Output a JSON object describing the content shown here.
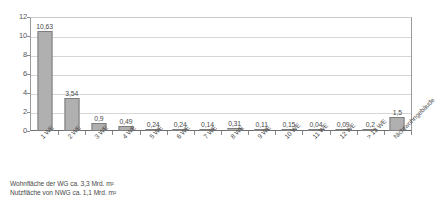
{
  "chart_data": {
    "type": "bar",
    "title": "",
    "subtitle": "",
    "xlabel": "",
    "ylabel": "",
    "ylim": [
      0,
      12
    ],
    "yticks": [
      0,
      2,
      4,
      6,
      8,
      10,
      12
    ],
    "ytick_labels": [
      "0",
      "2",
      "4",
      "6",
      "8",
      "10",
      "12"
    ],
    "grid": true,
    "legend": "none",
    "categories": [
      "1 WE",
      "2 WE",
      "3 WE",
      "4 WE",
      "5 WE",
      "6 WE",
      "7 WE",
      "8 WE",
      "9 WE",
      "10 WE",
      "11 WE",
      "12 WE",
      "> 12 WE",
      "Nichtwohngebäude"
    ],
    "values": [
      10.63,
      3.54,
      0.9,
      0.49,
      0.24,
      0.24,
      0.14,
      0.31,
      0.11,
      0.15,
      0.04,
      0.09,
      0.2,
      1.5
    ],
    "value_labels": [
      "10,63",
      "3,54",
      "0,9",
      "0,49",
      "0,24",
      "0,24",
      "0,14",
      "0,31",
      "0,11",
      "0,15",
      "0,04",
      "0,09",
      "0,2",
      "1,5"
    ],
    "bar_color": "#b0b0b0",
    "bar_border_color": "#7d7d7d",
    "grid_color": "#d6d6d6",
    "axis_color": "#6e6e6e"
  },
  "footnote": {
    "line1": "Wohnfläche der WG ca. 3,3 Mrd. m²",
    "line2": "Nutzfläche von NWG ca. 1,1 Mrd. m²"
  }
}
